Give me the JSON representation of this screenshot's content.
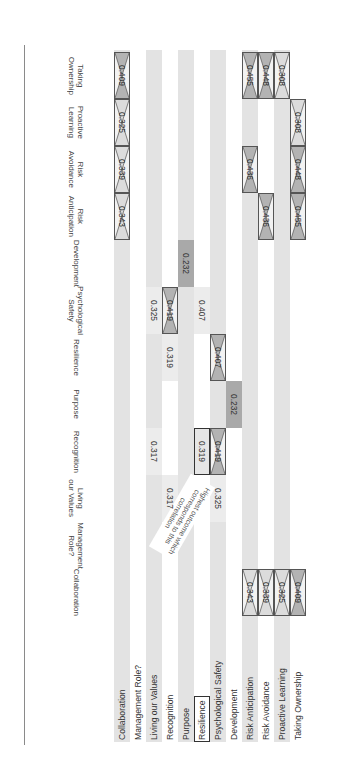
{
  "table": {
    "columns": [
      "Collaboration",
      "Management Role?",
      "Living our Values",
      "Recognition",
      "Purpose",
      "Resilience",
      "Psychological Safety",
      "Development",
      "Risk Anticipation",
      "Risk Avoidance",
      "Proactive Learning",
      "Taking Ownership"
    ],
    "column_headers": {
      "c0": [
        "Collaboration"
      ],
      "c1": [
        "Management",
        "Role?"
      ],
      "c2": [
        "Living",
        "our Values"
      ],
      "c3": [
        "Recognition"
      ],
      "c4": [
        "Purpose"
      ],
      "c5": [
        "Resilience"
      ],
      "c6": [
        "Psychological",
        "Safety"
      ],
      "c7": [
        "Development"
      ],
      "c8": [
        "Risk",
        "Anticipation"
      ],
      "c9": [
        "Risk",
        "Avoidance"
      ],
      "c10": [
        "Proactive",
        "Learning"
      ],
      "c11": [
        "Taking",
        "Ownership"
      ]
    },
    "rows": [
      {
        "label": "Collaboration"
      },
      {
        "label": "Management Role?"
      },
      {
        "label": "Living our Values"
      },
      {
        "label": "Recognition"
      },
      {
        "label": "Purpose"
      },
      {
        "label": "Resilience",
        "highlighted": true
      },
      {
        "label": "Psychological Safety"
      },
      {
        "label": "Development"
      },
      {
        "label": "Risk Anticipation"
      },
      {
        "label": "Risk Avoidance"
      },
      {
        "label": "Proactive Learning"
      },
      {
        "label": "Taking Ownership"
      }
    ],
    "cells": [
      {
        "row": "Collaboration",
        "col": "Risk Anticipation",
        "value": "0.343",
        "style": "crossed"
      },
      {
        "row": "Collaboration",
        "col": "Risk Avoidance",
        "value": "0.339",
        "style": "crossed"
      },
      {
        "row": "Collaboration",
        "col": "Proactive Learning",
        "value": "0.325",
        "style": "crossed"
      },
      {
        "row": "Collaboration",
        "col": "Taking Ownership",
        "value": "0.409",
        "style": "crossed"
      },
      {
        "row": "Living our Values",
        "col": "Recognition",
        "value": "0.317",
        "style": "plain"
      },
      {
        "row": "Living our Values",
        "col": "Psychological Safety",
        "value": "0.325",
        "style": "plain"
      },
      {
        "row": "Recognition",
        "col": "Living our Values",
        "value": "0.317",
        "style": "plain"
      },
      {
        "row": "Recognition",
        "col": "Resilience",
        "value": "0.319",
        "style": "plain"
      },
      {
        "row": "Recognition",
        "col": "Psychological Safety",
        "value": "0.419",
        "style": "crossed"
      },
      {
        "row": "Purpose",
        "col": "Development",
        "value": "0.232",
        "style": "dark"
      },
      {
        "row": "Resilience",
        "col": "Recognition",
        "value": "0.319",
        "style": "boxed"
      },
      {
        "row": "Resilience",
        "col": "Psychological Safety",
        "value": "0.407",
        "style": "plain"
      },
      {
        "row": "Psychological Safety",
        "col": "Living our Values",
        "value": "0.325",
        "style": "plain"
      },
      {
        "row": "Psychological Safety",
        "col": "Recognition",
        "value": "0.419",
        "style": "crossed"
      },
      {
        "row": "Psychological Safety",
        "col": "Resilience",
        "value": "0.407",
        "style": "crossed"
      },
      {
        "row": "Development",
        "col": "Purpose",
        "value": "0.232",
        "style": "dark"
      },
      {
        "row": "Risk Anticipation",
        "col": "Collaboration",
        "value": "0.343",
        "style": "crossed"
      },
      {
        "row": "Risk Anticipation",
        "col": "Risk Avoidance",
        "value": "0.436",
        "style": "crossed"
      },
      {
        "row": "Risk Anticipation",
        "col": "Taking Ownership",
        "value": "0.455",
        "style": "crossed"
      },
      {
        "row": "Risk Avoidance",
        "col": "Collaboration",
        "value": "0.339",
        "style": "crossed"
      },
      {
        "row": "Risk Avoidance",
        "col": "Risk Anticipation",
        "value": "0.436",
        "style": "crossed"
      },
      {
        "row": "Risk Avoidance",
        "col": "Taking Ownership",
        "value": "0.448",
        "style": "crossed"
      },
      {
        "row": "Proactive Learning",
        "col": "Collaboration",
        "value": "0.325",
        "style": "crossed"
      },
      {
        "row": "Proactive Learning",
        "col": "Taking Ownership",
        "value": "0.308",
        "style": "crossed"
      },
      {
        "row": "Taking Ownership",
        "col": "Collaboration",
        "value": "0.409",
        "style": "crossed"
      },
      {
        "row": "Taking Ownership",
        "col": "Risk Anticipation",
        "value": "0.455",
        "style": "crossed"
      },
      {
        "row": "Taking Ownership",
        "col": "Risk Avoidance",
        "value": "0.448",
        "style": "crossed"
      },
      {
        "row": "Taking Ownership",
        "col": "Proactive Learning",
        "value": "0.308",
        "style": "crossed"
      }
    ]
  },
  "annotation": {
    "text": "Highest outcome which corresponds to this correlation"
  },
  "colors": {
    "stripe": "#e3e3e3",
    "dark_cell": "#a9a9a9",
    "crossed_fill_dark": "#b3b3b3",
    "crossed_fill_light": "#dcdcdc",
    "border": "#333333"
  }
}
